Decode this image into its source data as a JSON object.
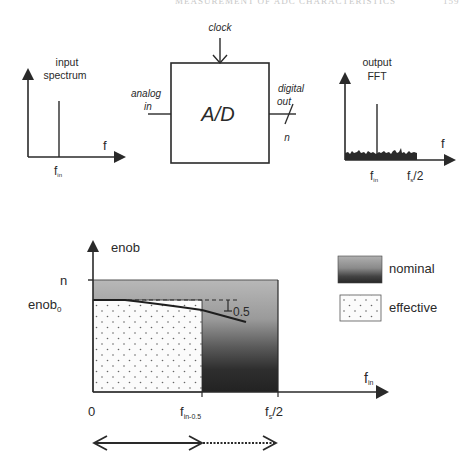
{
  "header": {
    "running_title": "MEASUREMENT OF ADC CHARACTERISTICS",
    "page_number": "159"
  },
  "input_spectrum": {
    "title_line1": "input",
    "title_line2": "spectrum",
    "x_label": "f",
    "tick_label_main": "f",
    "tick_label_sub": "in"
  },
  "adc_block": {
    "label": "A/D",
    "clock_label": "clock",
    "input_label_line1": "analog",
    "input_label_line2": "in",
    "output_label_line1": "digital",
    "output_label_line2": "out",
    "bus_width_label": "n"
  },
  "output_fft": {
    "title_line1": "output",
    "title_line2": "FFT",
    "x_label": "f",
    "tick1_main": "f",
    "tick1_sub": "in",
    "tick2_main": "f",
    "tick2_sub": "s",
    "tick2_suffix": "/2"
  },
  "enob_chart": {
    "y_label": "enob",
    "y_tick_n": "n",
    "y_tick_enob0_main": "enob",
    "y_tick_enob0_sub": "0",
    "x_label_main": "f",
    "x_label_sub": "in",
    "x_tick_zero": "0",
    "x_tick_mid_main": "f",
    "x_tick_mid_sub": "in-0.5",
    "x_tick_end_main": "f",
    "x_tick_end_sub": "s",
    "x_tick_end_suffix": "/2",
    "drop_annotation": "0.5"
  },
  "legend": {
    "items": [
      {
        "label": "nominal",
        "style": "gradient-gray"
      },
      {
        "label": "effective",
        "style": "dotted-white"
      }
    ]
  },
  "range_arrows": {
    "solid": "0 to f_in-0.5",
    "dotted": "f_in-0.5 to f_s/2"
  },
  "colors": {
    "line": "#2a2a2a",
    "nominal_top": "#b4b4b4",
    "nominal_bottom": "#262626",
    "effective_fill": "#fafafa",
    "dot": "#666666"
  }
}
